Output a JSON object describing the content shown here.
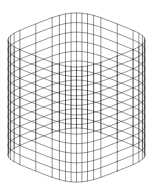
{
  "figure": {
    "type": "wireframe-3d",
    "background": "#ffffff",
    "stroke_color": "#1a1a1a",
    "stroke_width": 0.55,
    "stroke_opacity": 0.85
  },
  "geometry": {
    "center_x": 76.5,
    "top_center_y": 40,
    "half_width": 68.5,
    "half_depth_y": 27,
    "height": 115,
    "superellipse_exponent": 4,
    "meridian_count": 40,
    "ring_count": 13,
    "ring_segments": 160
  }
}
